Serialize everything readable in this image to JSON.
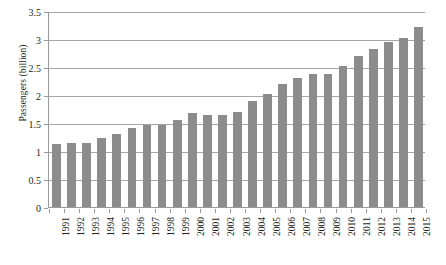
{
  "chart_data": {
    "type": "bar",
    "title": "",
    "subtitle": "",
    "xlabel": "",
    "ylabel": "Passengers (billion)",
    "ylim": [
      0,
      3.5
    ],
    "ytick_labels": [
      "0",
      "0.5",
      "1",
      "1.5",
      "2",
      "2.5",
      "3",
      "3.5"
    ],
    "ytick_values": [
      0,
      0.5,
      1,
      1.5,
      2,
      2.5,
      3,
      3.5
    ],
    "grid": "horizontal",
    "legend": null,
    "legend_position": "none",
    "bar_color": "#8c8c8c",
    "gridline_color": "#a6a6a6",
    "axis_color": "#9a9a9a",
    "text_color": "#231f20",
    "background_color": "#ffffff",
    "categories": [
      "1991",
      "1992",
      "1993",
      "1994",
      "1995",
      "1996",
      "1997",
      "1998",
      "1999",
      "2000",
      "2001",
      "2002",
      "2003",
      "2004",
      "2005",
      "2006",
      "2007",
      "2008",
      "2009",
      "2010",
      "2011",
      "2012",
      "2013",
      "2014",
      "2015"
    ],
    "values": [
      1.13,
      1.15,
      1.14,
      1.24,
      1.3,
      1.41,
      1.46,
      1.47,
      1.56,
      1.67,
      1.65,
      1.64,
      1.7,
      1.89,
      2.02,
      2.2,
      2.3,
      2.38,
      2.38,
      2.51,
      2.69,
      2.82,
      2.94,
      3.02,
      3.21
    ]
  }
}
